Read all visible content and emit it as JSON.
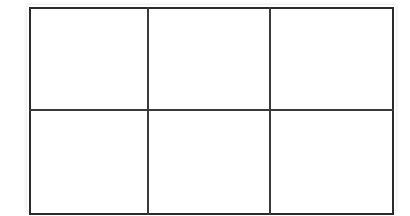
{
  "document": {
    "kind": "line-drawing",
    "description": "blank three-by-two grid of rectangles",
    "background_color": "#ffffff"
  },
  "figure": {
    "title": "",
    "caption": "",
    "columns": 3,
    "rows": 2,
    "geometry": {
      "left": 29,
      "top": 7,
      "width": 365,
      "height": 202,
      "column_widths": [
        119,
        122,
        124
      ],
      "row_heights": [
        100,
        102
      ],
      "outer_border_width": 2,
      "inner_line_width": 2
    },
    "colors": {
      "outer_border": "#2b2b2b",
      "inner_line": "#3a3a3a",
      "cell_fill": "#ffffff",
      "page": "#ffffff",
      "halo": "#bdbdbd"
    },
    "cells": [
      {
        "id": "r1c1",
        "row": 1,
        "column": 1,
        "text": ""
      },
      {
        "id": "r1c2",
        "row": 1,
        "column": 2,
        "text": ""
      },
      {
        "id": "r1c3",
        "row": 1,
        "column": 3,
        "text": ""
      },
      {
        "id": "r2c1",
        "row": 2,
        "column": 1,
        "text": ""
      },
      {
        "id": "r2c2",
        "row": 2,
        "column": 2,
        "text": ""
      },
      {
        "id": "r2c3",
        "row": 2,
        "column": 3,
        "text": ""
      }
    ]
  }
}
